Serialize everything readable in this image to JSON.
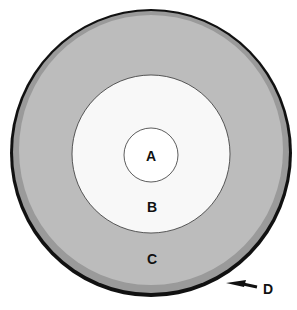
{
  "diagram": {
    "type": "concentric-layers",
    "labels": {
      "a": "A",
      "b": "B",
      "c": "C",
      "d": "D"
    },
    "colors": {
      "background": "#ffffff",
      "layer_a": "#ffffff",
      "layer_b": "#f7f7f7",
      "layer_c": "#b9b9b9",
      "layer_c_inner_rim": "#a6a6a6",
      "outer_ring": "#111111",
      "arrow": "#111111"
    }
  }
}
